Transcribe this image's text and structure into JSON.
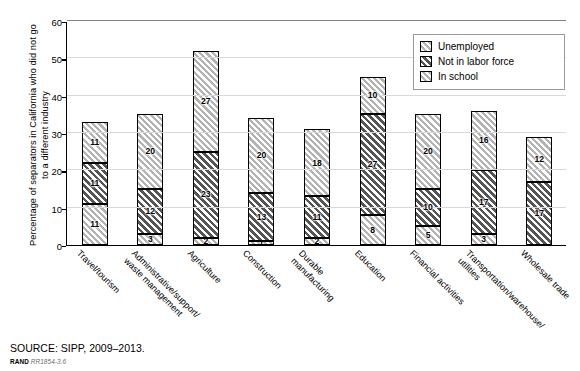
{
  "chart_data": {
    "type": "bar",
    "stacked": true,
    "title": "",
    "xlabel": "",
    "ylabel": "Percentage of separators in California who did not go to a different industry",
    "ylim": [
      0,
      60
    ],
    "yticks": [
      0,
      10,
      20,
      30,
      40,
      50,
      60
    ],
    "grid": true,
    "legend_position": "top-right",
    "categories": [
      "Travel/tourism",
      "Administrative/support/\nwaste management",
      "Agriculture",
      "Construction",
      "Durable\nmanufacturing",
      "Education",
      "Financial activities",
      "Transportation/warehouse/\nutilities",
      "Wholesale trade"
    ],
    "series": [
      {
        "name": "In school",
        "fill": "light",
        "values": [
          11,
          3,
          2,
          1,
          2,
          8,
          5,
          3,
          0
        ]
      },
      {
        "name": "Not in labor force",
        "fill": "dark",
        "values": [
          11,
          12,
          23,
          13,
          11,
          27,
          10,
          17,
          17
        ]
      },
      {
        "name": "Unemployed",
        "fill": "light",
        "values": [
          11,
          20,
          27,
          20,
          18,
          10,
          20,
          16,
          12
        ]
      }
    ],
    "totals": [
      33,
      35,
      52,
      34,
      31,
      45,
      35,
      36,
      29
    ]
  },
  "legend": {
    "items": [
      {
        "label": "Unemployed",
        "fill": "light"
      },
      {
        "label": "Not in labor force",
        "fill": "dark"
      },
      {
        "label": "In school",
        "fill": "light"
      }
    ]
  },
  "footer": {
    "source": "SOURCE: SIPP, 2009–2013.",
    "rand_brand": "RAND",
    "rand_ref": "RR1854-3.6"
  },
  "colors": {
    "axis": "#000000",
    "gridline": "#d9d9d9",
    "light_fill": "#d6d6d6",
    "dark_fill": "#6e6e6e",
    "legend_border": "#9a9a9a"
  }
}
